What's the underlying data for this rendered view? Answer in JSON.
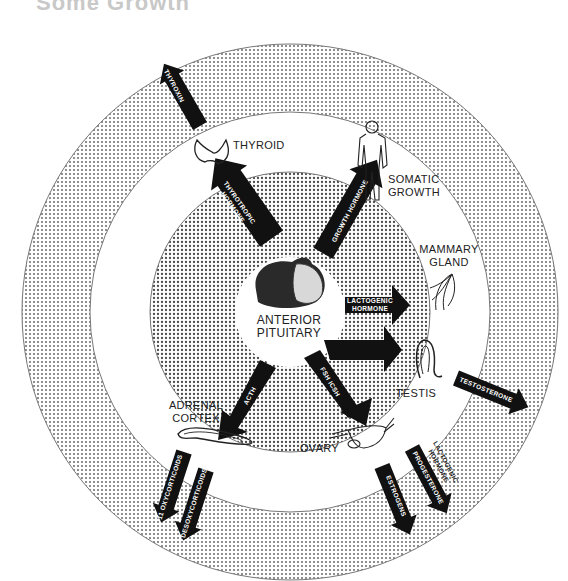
{
  "title": "Some Growth",
  "center": {
    "line1": "ANTERIOR",
    "line2": "PITUITARY"
  },
  "targets": {
    "thyroid": "THYROID",
    "somatic_line1": "SOMATIC",
    "somatic_line2": "GROWTH",
    "mammary_line1": "MAMMARY",
    "mammary_line2": "GLAND",
    "testis": "TESTIS",
    "ovary": "OVARY",
    "adrenal_line1": "ADRENAL",
    "adrenal_line2": "CORTEX"
  },
  "pituitary_hormones": {
    "thyrotropic_line1": "THYROTROPIC",
    "thyrotropic_line2": "HORMONE",
    "growth": "GROWTH HORMONE",
    "lactogenic_line1": "LACTOGENIC",
    "lactogenic_line2": "HORMONE",
    "fsh": "FSH ICSH",
    "acth": "ACTH"
  },
  "target_hormones": {
    "thyroxin": "THYROXIN",
    "testosterone": "TESTOSTERONE",
    "lactogenic_line1": "LACTOGENIC",
    "lactogenic_line2": "HORMONE",
    "progesterone": "PROGESTERONE",
    "estrogens": "ESTROGENS",
    "oxycorticoids": "11 OXYCORTICOIDS",
    "desoxycorticoids": "DESOXYCORTICOIDS"
  },
  "colors": {
    "ink": "#111111",
    "dot": "#555555",
    "paper": "#ffffff"
  }
}
